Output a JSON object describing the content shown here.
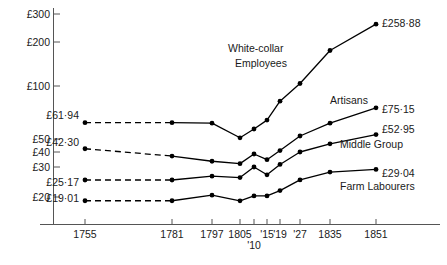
{
  "chart_data": {
    "type": "line",
    "title": "",
    "xlabel": "",
    "ylabel": "",
    "scale": "log",
    "grid": false,
    "legend_position": "inline-right",
    "ylim": [
      15,
      320
    ],
    "y_ticks": [
      "£300",
      "£200",
      "£100",
      "£50",
      "£40",
      "£30",
      "£20"
    ],
    "y_tick_values": [
      300,
      200,
      100,
      50,
      40,
      30,
      20
    ],
    "x_tick_labels": [
      "1755",
      "1781",
      "1797",
      "1805",
      "'10",
      "'15",
      "'19",
      "'27",
      "1835",
      "1851"
    ],
    "x_tick_values": [
      1755,
      1781,
      1797,
      1805,
      1810,
      1815,
      1819,
      1827,
      1835,
      1851
    ],
    "annotations": [
      {
        "text": "White-collar Employees",
        "line1": "White-collar",
        "line2": "Employees"
      },
      {
        "text": "Artisans"
      },
      {
        "text": "Middle Group"
      },
      {
        "text": "Farm Labourers"
      }
    ],
    "series": [
      {
        "name": "White-collar Employees",
        "start_label": "£61·94",
        "end_label": "£258·88",
        "x": [
          1755,
          1781,
          1797,
          1805,
          1810,
          1815,
          1819,
          1827,
          1835,
          1851
        ],
        "values": [
          61.94,
          61.94,
          61.5,
          50.8,
          57.0,
          64.0,
          82.0,
          104.0,
          175.0,
          258.88
        ],
        "dashed_segment": [
          1755,
          1781
        ]
      },
      {
        "name": "Artisans",
        "start_label": "£42·30",
        "end_label": "£75·15",
        "x": [
          1755,
          1781,
          1797,
          1805,
          1810,
          1815,
          1819,
          1827,
          1835,
          1851
        ],
        "values": [
          42.3,
          37.0,
          33.5,
          32.0,
          38.5,
          34.5,
          41.0,
          52.0,
          61.5,
          75.15
        ],
        "dashed_segment": [
          1755,
          1781
        ]
      },
      {
        "name": "Middle Group",
        "start_label": "£25·17",
        "end_label": "£52·95",
        "x": [
          1755,
          1781,
          1797,
          1805,
          1810,
          1815,
          1819,
          1827,
          1835,
          1851
        ],
        "values": [
          25.17,
          25.17,
          26.5,
          26.0,
          30.0,
          27.0,
          31.5,
          40.0,
          46.0,
          52.95
        ],
        "dashed_segment": [
          1755,
          1781
        ]
      },
      {
        "name": "Farm Labourers",
        "start_label": "£19·01",
        "end_label": "£29·04",
        "x": [
          1755,
          1781,
          1797,
          1805,
          1810,
          1815,
          1819,
          1827,
          1835,
          1851
        ],
        "values": [
          19.01,
          19.01,
          20.5,
          19.0,
          20.3,
          20.3,
          21.8,
          25.2,
          28.0,
          29.04
        ],
        "dashed_segment": [
          1755,
          1781
        ]
      }
    ]
  },
  "axis": {
    "y_labels": [
      {
        "text": "£300",
        "y": 10
      },
      {
        "text": "£200",
        "y": 38
      },
      {
        "text": "£100",
        "y": 82
      },
      {
        "text": "£50",
        "y": 135
      },
      {
        "text": "£40",
        "y": 148
      },
      {
        "text": "£30",
        "y": 163
      },
      {
        "text": "£20",
        "y": 193
      }
    ],
    "x_labels": [
      {
        "text": "1755",
        "x": 85
      },
      {
        "text": "1781",
        "x": 172
      },
      {
        "text": "1797",
        "x": 212
      },
      {
        "text": "1805",
        "x": 240
      },
      {
        "text": "'10",
        "x": 254
      },
      {
        "text": "'15",
        "x": 267
      },
      {
        "text": "'19",
        "x": 280
      },
      {
        "text": "'27",
        "x": 300
      },
      {
        "text": "1835",
        "x": 330
      },
      {
        "text": "1851",
        "x": 376
      }
    ]
  },
  "labels": {
    "white_collar_line1": "White-collar",
    "white_collar_line2": "Employees",
    "artisans": "Artisans",
    "middle_group": "Middle Group",
    "farm_labourers": "Farm Labourers",
    "wc_start": "£61·94",
    "wc_end": "£258·88",
    "ar_start": "£42·30",
    "ar_end": "£75·15",
    "mg_start": "£25·17",
    "mg_end": "£52·95",
    "fl_start": "£19·01",
    "fl_end": "£29·04"
  }
}
